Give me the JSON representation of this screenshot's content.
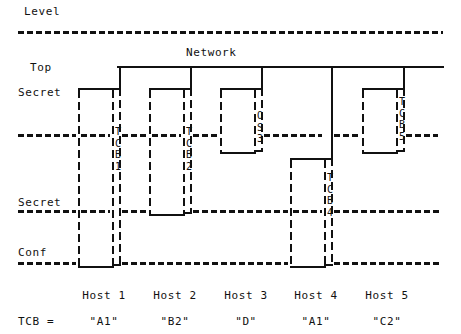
{
  "diagram": {
    "title": "Level",
    "network_label": "Network",
    "axis_labels": [
      {
        "id": "level",
        "text": "Level"
      },
      {
        "id": "top",
        "text": "Top"
      },
      {
        "id": "top-secret",
        "text": "Secret"
      },
      {
        "id": "secret",
        "text": "Secret"
      },
      {
        "id": "conf",
        "text": "Conf"
      }
    ],
    "tcb_row_label": "TCB =",
    "hosts": [
      {
        "name": "Host 1",
        "tcb": "\"A1\"",
        "tcb_stack": "T\nC\nB\n1"
      },
      {
        "name": "Host 2",
        "tcb": "\"B2\"",
        "tcb_stack": "T\nC\nB\n2"
      },
      {
        "name": "Host 3",
        "tcb": "\"D\"",
        "tcb_stack": "O\nS\n3"
      },
      {
        "name": "Host 4",
        "tcb": "\"A1\"",
        "tcb_stack": "T\nC\nB\n4"
      },
      {
        "name": "Host 5",
        "tcb": "\"C2\"",
        "tcb_stack": "T\nC\nB\n5"
      }
    ],
    "levels": [
      {
        "id": "level-rule",
        "name": "Level"
      },
      {
        "id": "top-secret-rule",
        "name": "Top Secret"
      },
      {
        "id": "secret-rule",
        "name": "Secret"
      },
      {
        "id": "conf-rule",
        "name": "Confidential"
      }
    ],
    "colors": {
      "ink": "#111111",
      "paper": "#ffffff"
    }
  }
}
